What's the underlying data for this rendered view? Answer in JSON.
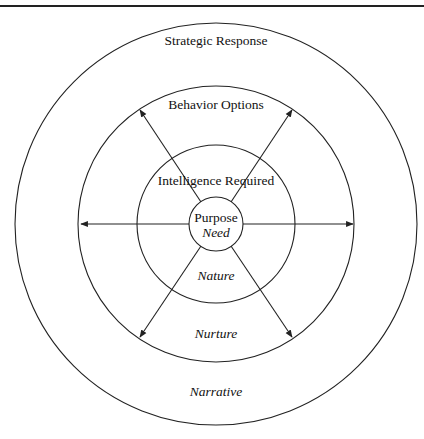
{
  "diagram": {
    "type": "concentric-circles",
    "center": [
      216,
      224
    ],
    "rings": [
      {
        "name": "Purpose",
        "radius": 27
      },
      {
        "name": "Intelligence Required",
        "radius": 79
      },
      {
        "name": "Behavior Options",
        "radius": 138
      },
      {
        "name": "Strategic Response",
        "radius": 201
      }
    ],
    "labels": {
      "strategic_response": "Strategic Response",
      "behavior_options": "Behavior Options",
      "intelligence_required": "Intelligence Required",
      "purpose": "Purpose",
      "need": "Need",
      "nature": "Nature",
      "nurture": "Nurture",
      "narrative": "Narrative"
    },
    "arrows": [
      {
        "direction": "left"
      },
      {
        "direction": "right"
      },
      {
        "direction": "upper-left"
      },
      {
        "direction": "upper-right"
      },
      {
        "direction": "lower-left"
      },
      {
        "direction": "lower-right"
      }
    ],
    "stroke_color": "#222222"
  }
}
